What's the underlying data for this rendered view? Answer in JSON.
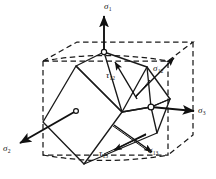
{
  "figure": {
    "colors": {
      "ink": "#111111",
      "background": "#ffffff",
      "solid_edge": "#1a1a1a",
      "dashed_edge": "#1a1a1a"
    },
    "labels": [
      {
        "id": "sigma-1",
        "symbol": "σ",
        "sub": "1",
        "x": 104,
        "y": 2,
        "name": "label-sigma-1"
      },
      {
        "id": "sigma-2",
        "symbol": "σ",
        "sub": "2",
        "x": 3,
        "y": 144,
        "name": "label-sigma-2"
      },
      {
        "id": "sigma-3",
        "symbol": "σ",
        "sub": "3",
        "x": 198,
        "y": 106,
        "name": "label-sigma-3"
      },
      {
        "id": "sigma-12",
        "symbol": "σ",
        "sub": "12",
        "x": 153,
        "y": 64,
        "name": "label-sigma-12"
      },
      {
        "id": "sigma-13",
        "symbol": "σ",
        "sub": "13",
        "x": 148,
        "y": 146,
        "name": "label-sigma-13"
      },
      {
        "id": "tau-12",
        "symbol": "τ",
        "sub": "12",
        "x": 106,
        "y": 71,
        "name": "label-tau-12"
      },
      {
        "id": "tau-13",
        "symbol": "τ",
        "sub": "13",
        "x": 99,
        "y": 149,
        "name": "label-tau-13"
      }
    ],
    "axes": [
      {
        "id": "sigma-1",
        "description": "principal stress axis 1, vertical up"
      },
      {
        "id": "sigma-2",
        "description": "principal stress axis 2, toward lower left"
      },
      {
        "id": "sigma-3",
        "description": "principal stress axis 3, toward right"
      }
    ],
    "shear_arrows": [
      {
        "id": "sigma-12",
        "description": "normal stress on rotated face, upper right"
      },
      {
        "id": "sigma-13",
        "description": "normal stress on rotated face, lower right"
      },
      {
        "id": "tau-12",
        "description": "shear stress on rotated face, upper"
      },
      {
        "id": "tau-13",
        "description": "shear stress on rotated face, lower"
      }
    ],
    "markers": [
      {
        "id": "top-vertex",
        "cx": 104,
        "cy": 52,
        "r": 2.6
      },
      {
        "id": "left-face",
        "cx": 76,
        "cy": 111,
        "r": 2.4
      },
      {
        "id": "right-vertex",
        "cx": 151,
        "cy": 107,
        "r": 2.8
      }
    ]
  }
}
